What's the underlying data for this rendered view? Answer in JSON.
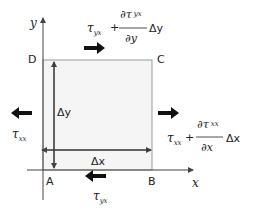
{
  "diagram": {
    "axes": {
      "x_label": "x",
      "y_label": "y"
    },
    "corners": {
      "A": "A",
      "B": "B",
      "C": "C",
      "D": "D"
    },
    "dimensions": {
      "dx": "Δx",
      "dy": "Δy"
    },
    "stresses": {
      "left": {
        "symbol": "τ",
        "sub": "xx"
      },
      "right": {
        "symbol": "τ",
        "sub": "xx",
        "plus": "+",
        "num_d": "∂τ",
        "num_sub": "xx",
        "den": "∂x",
        "tail": "Δx"
      },
      "top": {
        "symbol": "τ",
        "sub": "yx",
        "plus": "+",
        "num_d": "∂τ",
        "num_sub": "yx",
        "den": "∂y",
        "tail": "Δy"
      },
      "bottom": {
        "symbol": "τ",
        "sub": "yx"
      }
    },
    "colors": {
      "element_fill": "#f5f5f5",
      "element_stroke": "#999999",
      "arrow": "#111111",
      "axis": "#444444"
    }
  }
}
